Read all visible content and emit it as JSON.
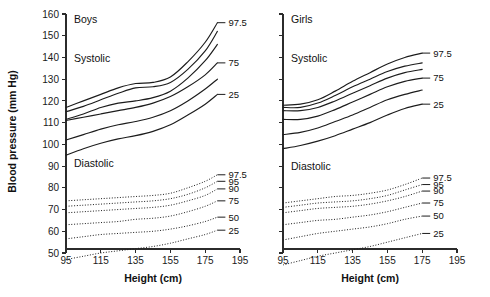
{
  "figure": {
    "background": "#ffffff",
    "ink": "#1c1c1c",
    "ylabel": "Blood pressure (mm Hg)",
    "xlabel": "Height (cm)"
  },
  "chart_data": {
    "type": "line",
    "title": "",
    "xlabel": "Height (cm)",
    "ylabel": "Blood pressure (mm Hg)",
    "xlim": [
      95,
      195
    ],
    "ylim": [
      42,
      162
    ],
    "xticks": [
      95,
      115,
      135,
      155,
      175,
      195
    ],
    "yticks": [
      50,
      60,
      70,
      80,
      90,
      100,
      110,
      120,
      130,
      140,
      150,
      160
    ],
    "grid": false,
    "legend": "right-of-curve end labels",
    "panels": [
      {
        "name": "Boys",
        "title": "Boys",
        "groups": [
          {
            "name": "Systolic",
            "label": "Systolic",
            "style": "solid",
            "x": [
              95,
              105,
              115,
              125,
              135,
              145,
              155,
              165,
              175,
              182
            ],
            "series": [
              {
                "name": "97.5",
                "label": "97.5",
                "show_label": true,
                "values": [
                  117,
                  120,
                  123,
                  126,
                  128,
                  128.5,
                  131,
                  138,
                  147,
                  156
                ]
              },
              {
                "name": "95",
                "label": "",
                "show_label": false,
                "values": [
                  115,
                  117.5,
                  120.5,
                  123.5,
                  126,
                  126.5,
                  128.5,
                  134.5,
                  143,
                  152
                ]
              },
              {
                "name": "90",
                "label": "",
                "show_label": false,
                "values": [
                  111.5,
                  114,
                  117,
                  119,
                  120,
                  121.5,
                  124.5,
                  130.5,
                  138.5,
                  146
                ]
              },
              {
                "name": "75",
                "label": "75",
                "show_label": true,
                "values": [
                  111,
                  112.5,
                  114,
                  115.5,
                  117,
                  119,
                  122,
                  126.5,
                  132,
                  137.5
                ]
              },
              {
                "name": "50",
                "label": "",
                "show_label": false,
                "values": [
                  102,
                  104.5,
                  107,
                  109,
                  110.5,
                  112.5,
                  115.5,
                  120,
                  125.5,
                  130
                ]
              },
              {
                "name": "25",
                "label": "25",
                "show_label": true,
                "values": [
                  95,
                  98,
                  100.5,
                  102.5,
                  104,
                  106,
                  109,
                  113.5,
                  118.5,
                  123
                ]
              }
            ]
          },
          {
            "name": "Diastolic",
            "label": "Diastolic",
            "style": "dotted",
            "x": [
              95,
              105,
              115,
              125,
              135,
              145,
              155,
              165,
              175,
              182
            ],
            "series": [
              {
                "name": "97.5",
                "label": "97.5",
                "show_label": true,
                "values": [
                  74,
                  74.5,
                  75,
                  75.5,
                  76,
                  76.5,
                  77.5,
                  80,
                  83,
                  86
                ]
              },
              {
                "name": "95",
                "label": "95",
                "show_label": true,
                "values": [
                  71.5,
                  72,
                  72.5,
                  73,
                  73.5,
                  74,
                  75,
                  77,
                  80,
                  83
                ]
              },
              {
                "name": "90",
                "label": "90",
                "show_label": true,
                "values": [
                  68.5,
                  69,
                  69.5,
                  70,
                  70.5,
                  71,
                  72,
                  74,
                  76.5,
                  79.5
                ]
              },
              {
                "name": "75",
                "label": "75",
                "show_label": true,
                "values": [
                  63,
                  63.5,
                  64,
                  64.5,
                  65.5,
                  66,
                  67,
                  69,
                  71.5,
                  74
                ]
              },
              {
                "name": "50",
                "label": "50",
                "show_label": true,
                "values": [
                  56.5,
                  57.5,
                  58.5,
                  59,
                  59.5,
                  60,
                  61,
                  62.5,
                  64.5,
                  66.5
                ]
              },
              {
                "name": "25",
                "label": "25",
                "show_label": true,
                "values": [
                  47,
                  48.5,
                  50,
                  51,
                  52,
                  53,
                  54.5,
                  56.5,
                  58.5,
                  60.5
                ]
              }
            ]
          }
        ]
      },
      {
        "name": "Girls",
        "title": "Girls",
        "groups": [
          {
            "name": "Systolic",
            "label": "Systolic",
            "style": "solid",
            "x": [
              95,
              105,
              115,
              125,
              135,
              145,
              155,
              165,
              175
            ],
            "series": [
              {
                "name": "97.5",
                "label": "97.5",
                "show_label": true,
                "values": [
                  118,
                  118.5,
                  120.5,
                  124.5,
                  129,
                  133,
                  137,
                  140,
                  142
                ]
              },
              {
                "name": "95",
                "label": "",
                "show_label": false,
                "values": [
                  117,
                  117,
                  119,
                  122.5,
                  126.5,
                  130,
                  133.5,
                  136,
                  137.5
                ]
              },
              {
                "name": "90",
                "label": "",
                "show_label": false,
                "values": [
                  115.5,
                  115.5,
                  117,
                  120,
                  123.5,
                  127,
                  130.5,
                  133,
                  134.5
                ]
              },
              {
                "name": "75",
                "label": "75",
                "show_label": true,
                "values": [
                  111.5,
                  111.5,
                  113,
                  116,
                  119.5,
                  123,
                  126.5,
                  129,
                  130.5
                ]
              },
              {
                "name": "50",
                "label": "",
                "show_label": false,
                "values": [
                  104.5,
                  105.5,
                  107.5,
                  110.5,
                  113.5,
                  117,
                  120.5,
                  123,
                  125
                ]
              },
              {
                "name": "25",
                "label": "25",
                "show_label": true,
                "values": [
                  98,
                  99.5,
                  101.5,
                  104,
                  107,
                  110,
                  113.5,
                  116.5,
                  118.5
                ]
              }
            ]
          },
          {
            "name": "Diastolic",
            "label": "Diastolic",
            "style": "dotted",
            "x": [
              95,
              105,
              115,
              125,
              135,
              145,
              155,
              165,
              175
            ],
            "series": [
              {
                "name": "97.5",
                "label": "97.5",
                "show_label": true,
                "values": [
                  73,
                  74,
                  75,
                  76,
                  76.5,
                  77.5,
                  79,
                  81.5,
                  84.5
                ]
              },
              {
                "name": "95",
                "label": "95",
                "show_label": true,
                "values": [
                  71,
                  72,
                  73,
                  73.5,
                  74,
                  75,
                  76.5,
                  79,
                  81.5
                ]
              },
              {
                "name": "90",
                "label": "90",
                "show_label": true,
                "values": [
                  68.5,
                  69.5,
                  70.5,
                  71,
                  71.5,
                  72.5,
                  74,
                  76,
                  78.5
                ]
              },
              {
                "name": "75",
                "label": "75",
                "show_label": true,
                "values": [
                  63,
                  64,
                  65,
                  65.5,
                  66.5,
                  67.5,
                  69,
                  71,
                  73
                ]
              },
              {
                "name": "50",
                "label": "50",
                "show_label": true,
                "values": [
                  56,
                  57.5,
                  59,
                  60,
                  61,
                  62,
                  63.5,
                  65.5,
                  67
                ]
              },
              {
                "name": "25",
                "label": "25",
                "show_label": true,
                "values": [
                  44.5,
                  46.5,
                  48.5,
                  50,
                  51.5,
                  53,
                  55,
                  57,
                  59
                ]
              }
            ]
          }
        ]
      }
    ]
  }
}
